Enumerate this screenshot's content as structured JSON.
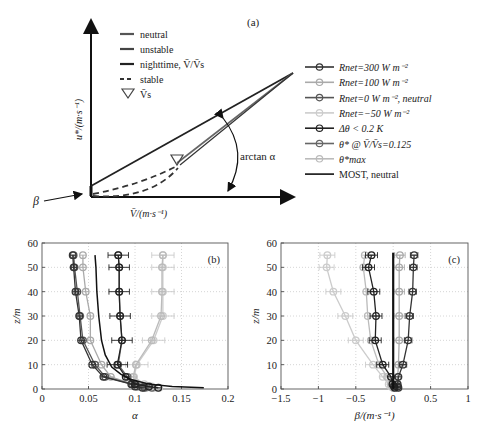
{
  "figure": {
    "panel_a": {
      "label": "(a)",
      "xlabel": "V̄/(m·s⁻¹)",
      "ylabel": "u*/(m·s⁻¹)",
      "beta_label": "β",
      "arc_label": "arctan α",
      "legend": [
        {
          "label": "neutral",
          "style": "solid",
          "color": "#555555"
        },
        {
          "label": "unstable",
          "style": "solid",
          "color": "#444444"
        },
        {
          "label": "nighttime, V̄/V̄s",
          "style": "solid",
          "color": "#222222"
        },
        {
          "label": "stable",
          "style": "dashed",
          "color": "#333333"
        },
        {
          "label": "V̄s",
          "style": "triangle",
          "color": "#444444"
        }
      ]
    },
    "series_legend": [
      {
        "label": "Rnet=300 W m⁻²",
        "color": "#333333"
      },
      {
        "label": "Rnet=100 W m⁻²",
        "color": "#aaaaaa"
      },
      {
        "label": "Rnet=0 W m⁻², neutral",
        "color": "#555555"
      },
      {
        "label": "Rnet=−50 W m⁻²",
        "color": "#cccccc"
      },
      {
        "label": "Δθ < 0.2 K",
        "color": "#222222"
      },
      {
        "label": "θ* @ V̄/V̄s=0.125",
        "color": "#666666"
      },
      {
        "label": "θ*max",
        "color": "#bbbbbb"
      },
      {
        "label": "MOST, neutral",
        "color": "#111111",
        "line_only": true
      }
    ]
  },
  "chart_data": [
    {
      "type": "line",
      "panel": "(b)",
      "title": "",
      "xlabel": "α",
      "ylabel": "z/m",
      "xlim": [
        0,
        0.2
      ],
      "ylim": [
        0,
        60
      ],
      "xticks": [
        "0",
        "0.05",
        "0.1",
        "0.15",
        "0.2"
      ],
      "yticks": [
        "0",
        "10",
        "20",
        "30",
        "40",
        "50",
        "60"
      ],
      "grid": true,
      "z": [
        0.5,
        1,
        2,
        5,
        10,
        20,
        30,
        40,
        50,
        55
      ],
      "series": [
        {
          "name": "Rnet=300 W m⁻²",
          "color": "#333333",
          "values": [
            0.108,
            0.1,
            0.096,
            0.066,
            0.054,
            0.042,
            0.04,
            0.036,
            0.034,
            0.033
          ]
        },
        {
          "name": "Rnet=100 W m⁻²",
          "color": "#aaaaaa",
          "values": [
            0.112,
            0.104,
            0.098,
            0.074,
            0.064,
            0.052,
            0.052,
            0.047,
            0.044,
            0.044
          ]
        },
        {
          "name": "Rnet=0 W m⁻², neutral",
          "color": "#555555",
          "values": [
            0.11,
            0.102,
            0.097,
            0.068,
            0.057,
            0.044,
            0.041,
            0.038,
            0.035,
            0.034
          ]
        },
        {
          "name": "Rnet=−50 W m⁻²",
          "color": "#cccccc",
          "values": [
            0.126,
            0.118,
            0.11,
            0.099,
            0.102,
            0.12,
            0.13,
            0.13,
            0.13,
            0.13
          ],
          "xerr": 0.012
        },
        {
          "name": "Δθ < 0.2 K",
          "color": "#222222",
          "values": [
            0.125,
            0.115,
            0.1,
            0.09,
            0.081,
            0.086,
            0.084,
            0.083,
            0.083,
            0.082
          ],
          "xerr": 0.011
        },
        {
          "name": "θ* @ V̄/V̄s=0.125",
          "color": "#666666",
          "values": [
            0.118,
            0.11,
            0.1,
            0.092,
            0.082,
            0.086,
            0.084,
            0.083,
            0.083,
            0.082
          ]
        },
        {
          "name": "θ*max",
          "color": "#bbbbbb",
          "values": [
            0.12,
            0.112,
            0.102,
            0.098,
            0.101,
            0.118,
            0.128,
            0.129,
            0.129,
            0.13
          ]
        }
      ],
      "most": {
        "name": "MOST, neutral",
        "color": "#111111",
        "points": [
          [
            0.174,
            0.5
          ],
          [
            0.14,
            1
          ],
          [
            0.115,
            2
          ],
          [
            0.095,
            4
          ],
          [
            0.085,
            6
          ],
          [
            0.075,
            9
          ],
          [
            0.068,
            14
          ],
          [
            0.064,
            20
          ],
          [
            0.061,
            30
          ],
          [
            0.059,
            40
          ],
          [
            0.058,
            50
          ],
          [
            0.057,
            55
          ]
        ]
      }
    },
    {
      "type": "line",
      "panel": "(c)",
      "title": "",
      "xlabel": "β/(m·s⁻¹)",
      "ylabel": "z/m",
      "xlim": [
        -1.5,
        1
      ],
      "ylim": [
        0,
        60
      ],
      "xticks": [
        "−1.5",
        "−1",
        "−0.5",
        "0",
        "0.5",
        "1"
      ],
      "yticks": [
        "0",
        "10",
        "20",
        "30",
        "40",
        "50",
        "60"
      ],
      "grid": true,
      "z": [
        0.5,
        1,
        2,
        5,
        10,
        20,
        30,
        40,
        50,
        55
      ],
      "series": [
        {
          "name": "Rnet=300 W m⁻²",
          "color": "#333333",
          "values": [
            0.07,
            0.06,
            0.06,
            0.07,
            0.13,
            0.2,
            0.22,
            0.26,
            0.27,
            0.28
          ],
          "xerr": 0.05
        },
        {
          "name": "Rnet=100 W m⁻²",
          "color": "#aaaaaa",
          "values": [
            0.05,
            0.05,
            0.05,
            0.06,
            0.07,
            0.08,
            0.08,
            0.08,
            0.08,
            0.09
          ],
          "xerr": 0.07
        },
        {
          "name": "Rnet=−50 W m⁻²",
          "color": "#cccccc",
          "values": [
            0.0,
            -0.03,
            -0.06,
            -0.14,
            -0.27,
            -0.5,
            -0.64,
            -0.8,
            -0.89,
            -0.88
          ],
          "xerr": 0.1
        },
        {
          "name": "Δθ < 0.2 K",
          "color": "#222222",
          "values": [
            0.02,
            0.01,
            -0.01,
            -0.03,
            -0.14,
            -0.24,
            -0.23,
            -0.26,
            -0.33,
            -0.29
          ],
          "xerr": 0.08
        },
        {
          "name": "θ*max",
          "color": "#bbbbbb",
          "values": [
            0.0,
            -0.01,
            -0.03,
            -0.08,
            -0.19,
            -0.3,
            -0.34,
            -0.36,
            -0.4,
            -0.38
          ]
        }
      ],
      "most": {
        "name": "MOST, neutral",
        "color": "#111111",
        "points": [
          [
            0.0,
            0
          ],
          [
            0.0,
            56
          ]
        ]
      }
    }
  ]
}
